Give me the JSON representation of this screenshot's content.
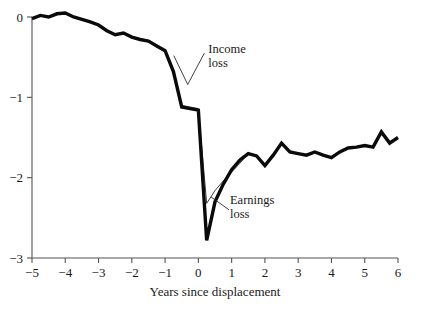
{
  "chart_data": {
    "type": "line",
    "title": "",
    "subtitle": "",
    "xlabel": "Years since displacement",
    "ylabel": "",
    "xlim": [
      -5,
      6
    ],
    "ylim": [
      -3,
      0
    ],
    "grid": false,
    "legend_position": "inline-annotations",
    "xticks": [
      -5,
      -4,
      -3,
      -2,
      -1,
      0,
      1,
      2,
      3,
      4,
      5,
      6
    ],
    "xtick_labels": [
      "−5",
      "−4",
      "−3",
      "−2",
      "−1",
      "0",
      "1",
      "2",
      "3",
      "4",
      "5",
      "6"
    ],
    "yticks": [
      0,
      -1,
      -2,
      -3
    ],
    "ytick_labels": [
      "0",
      "−1",
      "−2",
      "−3"
    ],
    "series": [
      {
        "name": "Earnings loss",
        "style": "thick",
        "color": "#0a0a0a",
        "x": [
          -5.0,
          -4.75,
          -4.5,
          -4.25,
          -4.0,
          -3.75,
          -3.5,
          -3.25,
          -3.0,
          -2.75,
          -2.5,
          -2.25,
          -2.0,
          -1.75,
          -1.5,
          -1.25,
          -1.0,
          -0.75,
          -0.5,
          -0.25,
          0.0,
          0.25,
          0.5,
          0.75,
          1.0,
          1.25,
          1.5,
          1.75,
          2.0,
          2.25,
          2.5,
          2.75,
          3.0,
          3.25,
          3.5,
          3.75,
          4.0,
          4.25,
          4.5,
          4.75,
          5.0,
          5.25,
          5.5,
          5.75,
          6.0
        ],
        "y": [
          -0.02,
          0.02,
          0.0,
          0.04,
          0.05,
          0.0,
          -0.03,
          -0.06,
          -0.1,
          -0.17,
          -0.22,
          -0.2,
          -0.25,
          -0.28,
          -0.3,
          -0.36,
          -0.42,
          -0.68,
          -1.12,
          -1.14,
          -1.16,
          -2.78,
          -2.3,
          -2.08,
          -1.9,
          -1.78,
          -1.7,
          -1.73,
          -1.85,
          -1.72,
          -1.57,
          -1.68,
          -1.7,
          -1.72,
          -1.68,
          -1.72,
          -1.75,
          -1.68,
          -1.63,
          -1.62,
          -1.6,
          -1.62,
          -1.43,
          -1.57,
          -1.5
        ]
      },
      {
        "name": "Income loss",
        "style": "thin",
        "color": "#2b2b2b",
        "x": [
          -0.75,
          -0.5,
          -0.25,
          0.0,
          0.25,
          0.5,
          0.75,
          1.0,
          1.25,
          1.5
        ],
        "y": [
          -0.68,
          -1.1,
          -1.12,
          -1.14,
          -2.32,
          -2.16,
          -2.04,
          -1.93,
          -1.82,
          -1.7
        ]
      }
    ],
    "annotations": [
      {
        "text_line1": "Income",
        "text_line2": "loss",
        "text_x": 0.3,
        "text_y": -0.45,
        "leader_points": [
          [
            0.18,
            -0.45
          ],
          [
            -0.32,
            -0.84
          ],
          [
            -0.74,
            -0.48
          ]
        ]
      },
      {
        "text_line1": "Earnings",
        "text_line2": "loss",
        "text_x": 0.95,
        "text_y": -2.33,
        "leader_points": [
          [
            0.92,
            -2.4
          ],
          [
            0.38,
            -2.24
          ]
        ]
      }
    ]
  },
  "axes": {
    "y_axis_label_0": "0",
    "y_axis_label_1": "−1",
    "y_axis_label_2": "−2",
    "y_axis_label_3": "−3",
    "x_axis_title": "Years since displacement"
  }
}
